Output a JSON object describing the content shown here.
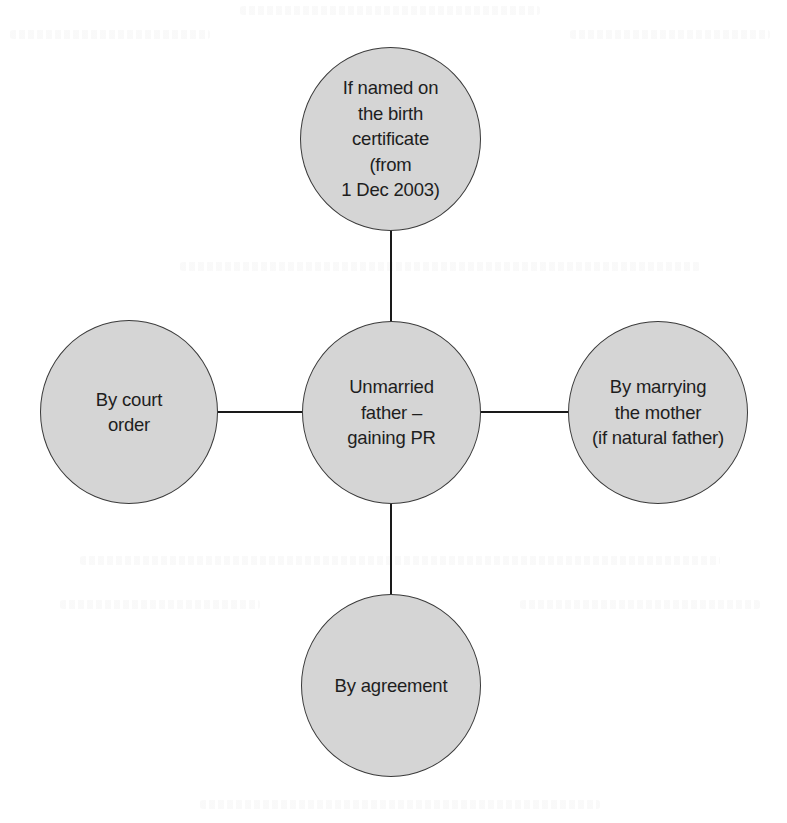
{
  "diagram": {
    "type": "hub-and-spoke",
    "colors": {
      "background": "#ffffff",
      "node_fill": "#d5d5d5",
      "node_stroke": "#3a3a3a",
      "connector": "#1a1a1a",
      "text": "#1e1e1e"
    },
    "center": {
      "id": "center",
      "label": "Unmarried\nfather –\ngaining PR"
    },
    "nodes": [
      {
        "id": "top",
        "position": "top",
        "label": "If named on\nthe birth\ncertificate\n(from\n1 Dec 2003)"
      },
      {
        "id": "left",
        "position": "left",
        "label": "By court\norder"
      },
      {
        "id": "right",
        "position": "right",
        "label": "By marrying\nthe mother\n(if natural father)"
      },
      {
        "id": "bottom",
        "position": "bottom",
        "label": "By agreement"
      }
    ],
    "edges": [
      {
        "from": "center",
        "to": "top"
      },
      {
        "from": "center",
        "to": "left"
      },
      {
        "from": "center",
        "to": "right"
      },
      {
        "from": "center",
        "to": "bottom"
      }
    ]
  }
}
